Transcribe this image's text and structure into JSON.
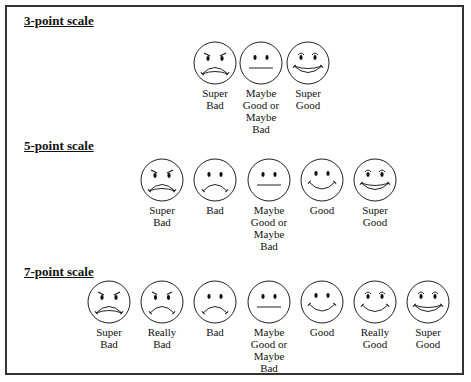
{
  "sections": [
    {
      "title": "3-point scale",
      "faces": [
        {
          "label": "Super\nBad",
          "expression": "super-bad"
        },
        {
          "label": "Maybe\nGood or\nMaybe\nBad",
          "expression": "neutral"
        },
        {
          "label": "Super\nGood",
          "expression": "super-good"
        }
      ]
    },
    {
      "title": "5-point scale",
      "faces": [
        {
          "label": "Super\nBad",
          "expression": "super-bad"
        },
        {
          "label": "Bad",
          "expression": "bad"
        },
        {
          "label": "Maybe\nGood or\nMaybe\nBad",
          "expression": "neutral"
        },
        {
          "label": "Good",
          "expression": "good"
        },
        {
          "label": "Super\nGood",
          "expression": "super-good"
        }
      ]
    },
    {
      "title": "7-point scale",
      "faces": [
        {
          "label": "Super\nBad",
          "expression": "super-bad"
        },
        {
          "label": "Really\nBad",
          "expression": "really-bad"
        },
        {
          "label": "Bad",
          "expression": "bad"
        },
        {
          "label": "Maybe\nGood or\nMaybe\nBad",
          "expression": "neutral"
        },
        {
          "label": "Good",
          "expression": "good"
        },
        {
          "label": "Really\nGood",
          "expression": "really-good"
        },
        {
          "label": "Super\nGood",
          "expression": "super-good"
        }
      ]
    }
  ],
  "colors": {
    "stroke": "#222222",
    "border": "#333333",
    "background": "#ffffff"
  }
}
